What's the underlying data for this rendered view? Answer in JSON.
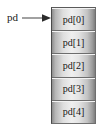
{
  "diagram": {
    "type": "pointer-to-array",
    "background_color": "#ffffff",
    "pointer": {
      "label": "pd",
      "arrow_icon": "right-arrow-icon",
      "arrow_direction": "right",
      "arrow_color": "#555555"
    },
    "array": {
      "name": "pd",
      "cell_count": 5,
      "fill_color": "#e4e4e4",
      "border_color": "#5a5a5a",
      "cells": [
        {
          "label": "pd[0]",
          "index": 0
        },
        {
          "label": "pd[1]",
          "index": 1
        },
        {
          "label": "pd[2]",
          "index": 2
        },
        {
          "label": "pd[3]",
          "index": 3
        },
        {
          "label": "pd[4]",
          "index": 4
        }
      ]
    }
  }
}
